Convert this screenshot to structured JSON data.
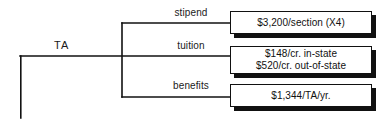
{
  "diagram": {
    "type": "bracket-tree",
    "root": {
      "label": "TA"
    },
    "branches": [
      {
        "label": "stipend",
        "value_lines": [
          "$3,200/section (X4)"
        ]
      },
      {
        "label": "tuition",
        "value_lines": [
          "$148/cr. in-state",
          "$520/cr. out-of-state"
        ]
      },
      {
        "label": "benefits",
        "value_lines": [
          "$1,344/TA/yr."
        ]
      }
    ],
    "colors": {
      "background": "#ffffff",
      "line": "#111111",
      "text": "#111111",
      "shadow": "#111111"
    }
  }
}
